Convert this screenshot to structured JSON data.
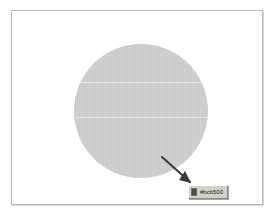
{
  "canvas": {
    "background_color": "#ffffff",
    "border_color": "#b9b9b9"
  },
  "shape": {
    "name": "circle",
    "fill_color": "#c9c9c9",
    "label": "circle"
  },
  "cursor": {
    "icon": "arrow-pointer-icon",
    "label": "pointer"
  },
  "tooltip": {
    "swatch_color": "#4a4a4a",
    "hex_value": "#bcb500",
    "swatch_icon": "color-swatch-icon"
  }
}
